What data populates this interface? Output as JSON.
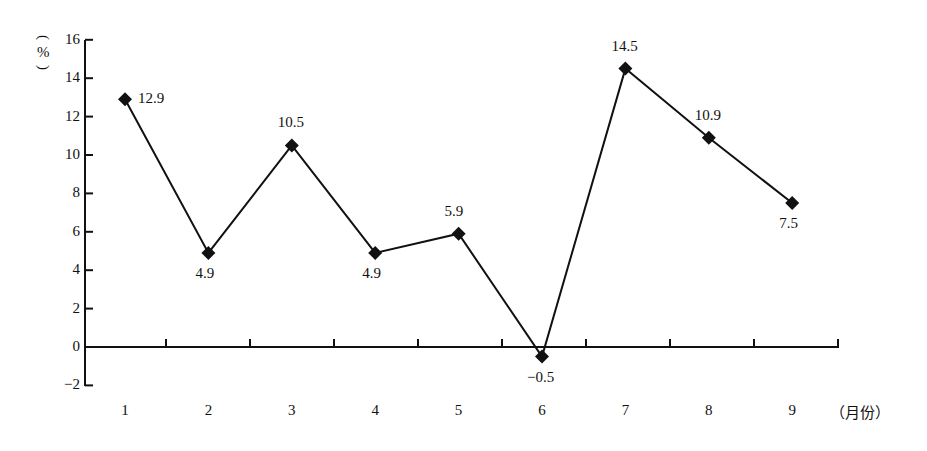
{
  "chart_data": {
    "type": "line",
    "title": "",
    "xlabel": "（月份）",
    "ylabel": "%",
    "categories": [
      "1",
      "2",
      "3",
      "4",
      "5",
      "6",
      "7",
      "8",
      "9"
    ],
    "series": [
      {
        "name": "",
        "values": [
          12.9,
          4.9,
          10.5,
          4.9,
          5.9,
          -0.5,
          14.5,
          10.9,
          7.5
        ],
        "marker": "diamond",
        "color": "#111111"
      }
    ],
    "data_labels": [
      "12.9",
      "4.9",
      "10.5",
      "4.9",
      "5.9",
      "−0.5",
      "14.5",
      "10.9",
      "7.5"
    ],
    "yticks": [
      "16",
      "14",
      "12",
      "10",
      "8",
      "6",
      "4",
      "2",
      "0",
      "−2"
    ],
    "ylim": [
      -2,
      16
    ],
    "grid": false,
    "legend": "none"
  }
}
